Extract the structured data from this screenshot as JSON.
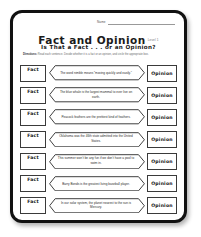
{
  "document": {
    "name_label": "Name",
    "title": "Fact and Opinion",
    "title_suffix": "Level 1",
    "subtitle": "Is That a Fact . . . or an Opinion?",
    "directions_prefix": "Directions:",
    "directions_text": " Read each sentence. Decide whether it is a fact or an opinion, and circle the appropriate box."
  },
  "labels": {
    "fact": "Fact",
    "opinion": "Opinion"
  },
  "colors": {
    "frame": "#111111",
    "page": "#ffffff",
    "ink": "#2e2e2e",
    "muted": "#6b6b6b"
  },
  "items": [
    {
      "number": 1,
      "fact_label": "Fact",
      "opinion_label": "Opinion",
      "sentence": "The word nimble means “moving quickly and easily.”"
    },
    {
      "number": 2,
      "fact_label": "Fact",
      "opinion_label": "Opinion",
      "sentence": "The blue whale is the largest mammal to ever live on earth."
    },
    {
      "number": 3,
      "fact_label": "Fact",
      "opinion_label": "Opinion",
      "sentence": "Peacock feathers are the prettiest kind of feathers."
    },
    {
      "number": 4,
      "fact_label": "Fact",
      "opinion_label": "Opinion",
      "sentence": "Oklahoma was the 46th state admitted into the United States."
    },
    {
      "number": 5,
      "fact_label": "Fact",
      "opinion_label": "Opinion",
      "sentence": "This summer won’t be any fun if we don’t have a pool to swim in."
    },
    {
      "number": 6,
      "fact_label": "Fact",
      "opinion_label": "Opinion",
      "sentence": "Barry Bonds is the greatest living baseball player."
    },
    {
      "number": 7,
      "fact_label": "Fact",
      "opinion_label": "Opinion",
      "sentence": "In our solar system, the planet nearest to the sun is Mercury."
    }
  ]
}
